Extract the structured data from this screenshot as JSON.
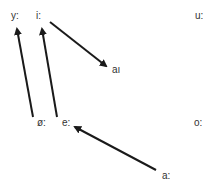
{
  "diagram": {
    "type": "vowel-shift",
    "line_color": "#1a1a1a",
    "text_color": "#333333",
    "labels": {
      "y": "y:",
      "i": "i:",
      "u": "u:",
      "ai": "aı",
      "oe": "ø:",
      "e": "e:",
      "o": "o:",
      "a": "a:"
    },
    "arrows": [
      {
        "from": "ø:",
        "to": "y:"
      },
      {
        "from": "e:",
        "to": "i:"
      },
      {
        "from": "i:",
        "to": "aı"
      },
      {
        "from": "a:",
        "to": "e:"
      }
    ]
  }
}
